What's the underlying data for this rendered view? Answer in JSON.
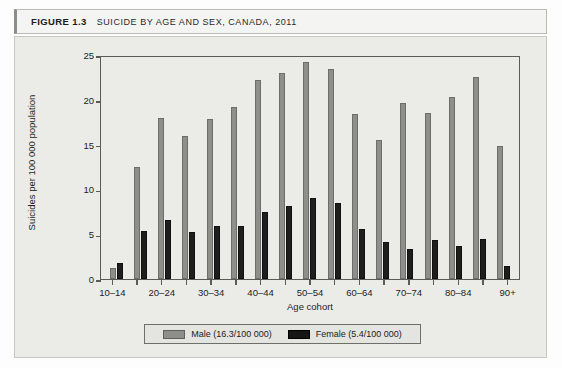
{
  "figure": {
    "number": "FIGURE 1.3",
    "title": "SUICIDE BY AGE AND SEX, CANADA, 2011"
  },
  "legend": {
    "male_label": "Male (16.3/100 000)",
    "female_label": "Female (5.4/100 000)",
    "male_color": "#8e8e8b",
    "female_color": "#1e1e1e"
  },
  "chart_data": {
    "type": "bar",
    "title": "SUICIDE BY AGE AND SEX, CANADA, 2011",
    "xlabel": "Age cohort",
    "ylabel": "Suicides per 100 000 population",
    "ylim": [
      0,
      25
    ],
    "yticks": [
      0,
      5,
      10,
      15,
      20,
      25
    ],
    "grid": false,
    "legend_position": "bottom",
    "categories": [
      "10–14",
      "15–19",
      "20–24",
      "25–29",
      "30–34",
      "35–39",
      "40–44",
      "45–49",
      "50–54",
      "55–59",
      "60–64",
      "65–69",
      "70–74",
      "75–79",
      "80–84",
      "85–89",
      "90+"
    ],
    "visible_tick_labels": [
      "10–14",
      "20–24",
      "30–34",
      "40–44",
      "50–54",
      "60–64",
      "70–74",
      "80–84",
      "90+"
    ],
    "series": [
      {
        "name": "Male (16.3/100 000)",
        "values": [
          1.2,
          12.5,
          18.0,
          16.0,
          17.9,
          19.2,
          22.2,
          23.0,
          24.2,
          23.4,
          18.4,
          15.5,
          19.7,
          18.5,
          20.3,
          22.6,
          14.8
        ]
      },
      {
        "name": "Female (5.4/100 000)",
        "values": [
          1.8,
          5.4,
          6.6,
          5.2,
          5.9,
          5.9,
          7.5,
          8.1,
          9.0,
          8.5,
          5.6,
          4.1,
          3.4,
          4.4,
          3.7,
          4.5,
          1.5
        ]
      }
    ]
  }
}
